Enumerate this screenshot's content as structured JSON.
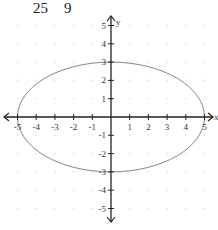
{
  "header_fragment": {
    "left": "25",
    "right": "9"
  },
  "chart_data": {
    "type": "line",
    "title": "",
    "equation": "x^2/25 + y^2/9 = 1",
    "ellipse": {
      "center": [
        0,
        0
      ],
      "semi_major_x": 5,
      "semi_minor_y": 3
    },
    "xlabel": "x",
    "ylabel": "y",
    "xlim": [
      -5,
      5
    ],
    "ylim": [
      -5,
      5
    ],
    "x_ticks": [
      "-5",
      "-4",
      "-3",
      "-2",
      "-1",
      "1",
      "2",
      "3",
      "4",
      "5"
    ],
    "y_ticks": [
      "5",
      "4",
      "3",
      "2",
      "1",
      "-1",
      "-2",
      "-3",
      "-4",
      "-5"
    ],
    "grid": "dotted",
    "colors": {
      "axis": "#222222",
      "curve": "#888888",
      "grid": "#dddddd"
    }
  }
}
